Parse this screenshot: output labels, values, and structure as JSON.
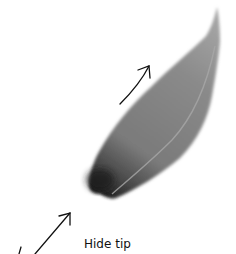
{
  "figure": {
    "caption": "Hide tip",
    "colors": {
      "background": "#ffffff",
      "stroke_light": "#8c8c8c",
      "stroke_mid": "#777777",
      "stroke_dark": "#1e1e1e",
      "arrow": "#111111"
    },
    "arrows": [
      {
        "name": "upper-direction-arrow",
        "from": [
          120,
          104
        ],
        "to": [
          149,
          66
        ]
      },
      {
        "name": "lower-direction-arrow",
        "from": [
          35,
          254
        ],
        "to": [
          70,
          213
        ]
      }
    ]
  }
}
